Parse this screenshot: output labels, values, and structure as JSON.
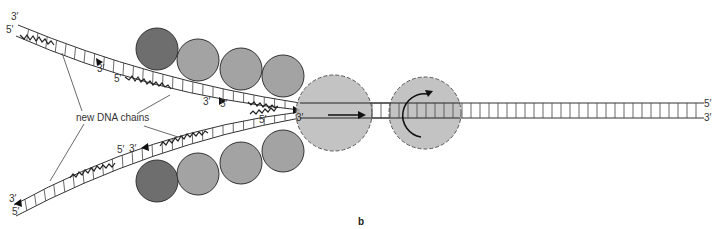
{
  "figure": {
    "caption": "b",
    "callout": "new DNA chains",
    "colors": {
      "dark_protein": "#6e6e6e",
      "light_protein": "#a3a3a3",
      "dashed_protein": "#b8b8b8",
      "strand": "#333333"
    },
    "labels": {
      "top_left_3": "3′",
      "top_left_5": "5′",
      "upper_mid_3": "3′",
      "upper_mid_5": "5′",
      "upper_fork_3": "3′",
      "upper_fork_5": "5′",
      "fork_center_3": "3′",
      "lower_fork_5": "5′",
      "lower_mid_5": "5′",
      "lower_mid_3": "3′",
      "bottom_left_3": "3′",
      "bottom_left_5": "5′",
      "right_5": "5′",
      "right_3": "3′"
    }
  }
}
